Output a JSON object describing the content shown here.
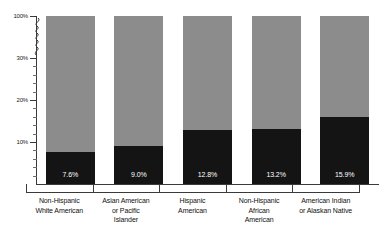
{
  "chart_data": {
    "type": "bar",
    "title": "",
    "subtitle": "",
    "xlabel": "",
    "ylabel": "",
    "grid": false,
    "legend": "none",
    "stacked": true,
    "axis_break": true,
    "axis_break_between": [
      30,
      100
    ],
    "ylim": [
      0,
      100
    ],
    "y_ticks": [
      {
        "value": 100,
        "label": "100%"
      },
      {
        "value": 30,
        "label": "30%"
      },
      {
        "value": 20,
        "label": "20%"
      },
      {
        "value": 10,
        "label": "10%"
      }
    ],
    "categories": [
      "Non-Hispanic White American",
      "Asian American or Pacific Islander",
      "Hispanic American",
      "Non-Hispanic African American",
      "American Indian or Alaskan Native"
    ],
    "category_lines": [
      [
        "Non-Hispanic",
        "White American"
      ],
      [
        "Asian American",
        "or Pacific",
        "Islander"
      ],
      [
        "Hispanic",
        "American"
      ],
      [
        "Non-Hispanic",
        "African",
        "American"
      ],
      [
        "American Indian",
        "or Alaskan Native"
      ]
    ],
    "values": [
      7.6,
      9.0,
      12.8,
      13.2,
      15.9
    ],
    "value_labels": [
      "7.6%",
      "9.0%",
      "12.8%",
      "13.2%",
      "15.9%"
    ],
    "remainder_values": [
      92.4,
      91.0,
      87.2,
      86.8,
      84.1
    ],
    "series": [
      {
        "name": "value",
        "color": "#141414",
        "values": [
          7.6,
          9.0,
          12.8,
          13.2,
          15.9
        ]
      },
      {
        "name": "remainder",
        "color": "#8c8c8c",
        "values": [
          92.4,
          91.0,
          87.2,
          86.8,
          84.1
        ]
      }
    ],
    "colors": {
      "value_segment": "#141414",
      "remainder_segment": "#8c8c8c",
      "axis": "#3a3a3a",
      "background": "#ffffff",
      "value_label_text": "#ffffff"
    }
  }
}
